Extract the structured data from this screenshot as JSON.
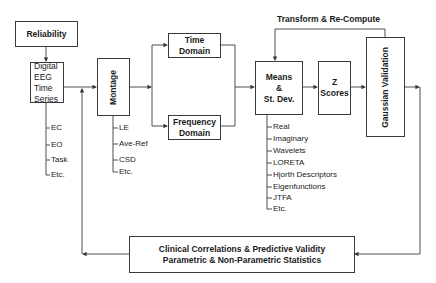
{
  "nodes": {
    "reliability": "Reliability",
    "digital_eeg": [
      "Digital",
      "EEG",
      "Time",
      "Series"
    ],
    "montage": "Montage",
    "time_domain": "Time Domain",
    "frequency_domain": [
      "Frequency",
      "Domain"
    ],
    "means": [
      "Means",
      "&",
      "St. Dev."
    ],
    "z_scores": [
      "Z",
      "Scores"
    ],
    "gaussian_validation": "Gaussian Validation",
    "clinical": [
      "Clinical Correlations & Predictive Validity",
      "Parametric & Non-Parametric Statistics"
    ]
  },
  "loop_label": "Transform & Re-Compute",
  "eeg_conditions": [
    "EC",
    "EO",
    "Task",
    "Etc."
  ],
  "montage_options": [
    "LE",
    "Ave-Ref",
    "CSD",
    "Etc."
  ],
  "measures": [
    "Real",
    "Imaginary",
    "Wavelets",
    "LORETA",
    "Hjorth Descriptors",
    "Eigenfunctions",
    "JTFA",
    "Etc."
  ],
  "colors": {
    "line": "#3a3a3a",
    "background": "#ffffff",
    "text": "#1a1a1a"
  }
}
